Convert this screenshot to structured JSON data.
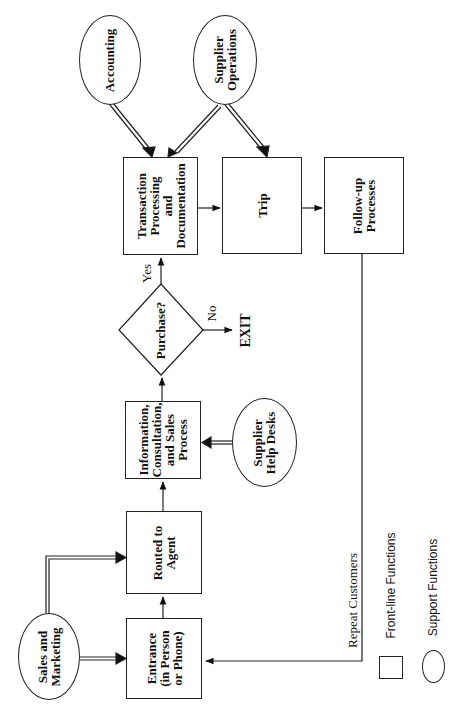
{
  "diagram": {
    "orientation": "rotated-90-ccw",
    "nodes": {
      "accounting": {
        "label": "Accounting",
        "shape": "ellipse",
        "type": "support"
      },
      "supplier_operations": {
        "label": "Supplier\nOperations",
        "shape": "ellipse",
        "type": "support"
      },
      "transaction": {
        "label": "Transaction\nProcessing\nand\nDocumentation",
        "shape": "box",
        "type": "front-line"
      },
      "trip": {
        "label": "Trip",
        "shape": "box",
        "type": "front-line"
      },
      "followup": {
        "label": "Follow-up\nProcesses",
        "shape": "box",
        "type": "front-line"
      },
      "purchase": {
        "label": "Purchase?",
        "shape": "diamond",
        "type": "decision"
      },
      "exit": {
        "label": "EXIT",
        "shape": "text"
      },
      "info": {
        "label": "Information,\nConsultation,\nand Sales\nProcess",
        "shape": "box",
        "type": "front-line"
      },
      "helpdesks": {
        "label": "Supplier\nHelp Desks",
        "shape": "ellipse",
        "type": "support"
      },
      "routed": {
        "label": "Routed to\nAgent",
        "shape": "box",
        "type": "front-line"
      },
      "entrance": {
        "label": "Entrance\n(in Person\nor Phone)",
        "shape": "box",
        "type": "front-line"
      },
      "sales": {
        "label": "Sales and\nMarketing",
        "shape": "ellipse",
        "type": "support"
      }
    },
    "edge_labels": {
      "yes": "Yes",
      "no": "No",
      "repeat": "Repeat Customers"
    },
    "edges": [
      {
        "from": "entrance",
        "to": "routed",
        "style": "single"
      },
      {
        "from": "routed",
        "to": "info",
        "style": "single"
      },
      {
        "from": "info",
        "to": "purchase",
        "style": "single"
      },
      {
        "from": "purchase",
        "to": "transaction",
        "style": "single",
        "label": "Yes"
      },
      {
        "from": "purchase",
        "to": "exit",
        "style": "single",
        "label": "No"
      },
      {
        "from": "transaction",
        "to": "trip",
        "style": "single"
      },
      {
        "from": "trip",
        "to": "followup",
        "style": "single"
      },
      {
        "from": "followup",
        "to": "entrance",
        "style": "single",
        "label": "Repeat Customers"
      },
      {
        "from": "accounting",
        "to": "transaction",
        "style": "double"
      },
      {
        "from": "supplier_operations",
        "to": "transaction",
        "style": "double"
      },
      {
        "from": "supplier_operations",
        "to": "trip",
        "style": "double"
      },
      {
        "from": "helpdesks",
        "to": "info",
        "style": "double"
      },
      {
        "from": "sales",
        "to": "entrance",
        "style": "double"
      },
      {
        "from": "sales",
        "to": "routed",
        "style": "double"
      }
    ],
    "legend": {
      "front_line": "Front-line Functions",
      "support": "Support Functions"
    }
  }
}
